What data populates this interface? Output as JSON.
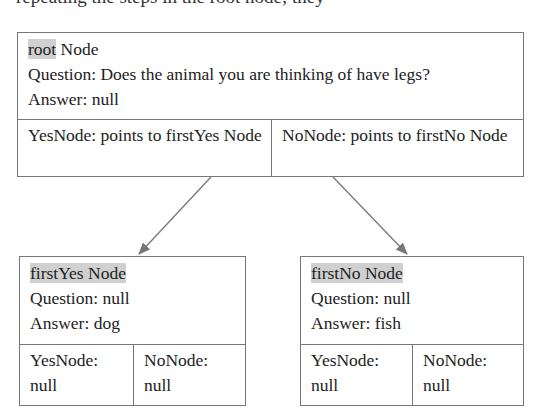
{
  "top_caption": "repeating the steps in the root node; they",
  "nodes": {
    "root": {
      "title_highlight": "root",
      "title_rest": " Node",
      "question": "Question: Does the animal you are thinking of have legs?",
      "answer": "Answer: null",
      "yes_ptr": "YesNode: points to firstYes Node",
      "no_ptr": "NoNode: points to firstNo Node"
    },
    "first_yes": {
      "title_highlight": "firstYes Node",
      "question": "Question: null",
      "answer": "Answer: dog",
      "yes_ptr": "YesNode: null",
      "no_ptr": "NoNode: null"
    },
    "first_no": {
      "title_highlight": "firstNo Node",
      "question": "Question: null",
      "answer": "Answer: fish",
      "yes_ptr": "YesNode: null",
      "no_ptr": "NoNode: null"
    }
  },
  "colors": {
    "border": "#777777",
    "highlight": "#d0d0d0",
    "arrow": "#777777"
  }
}
